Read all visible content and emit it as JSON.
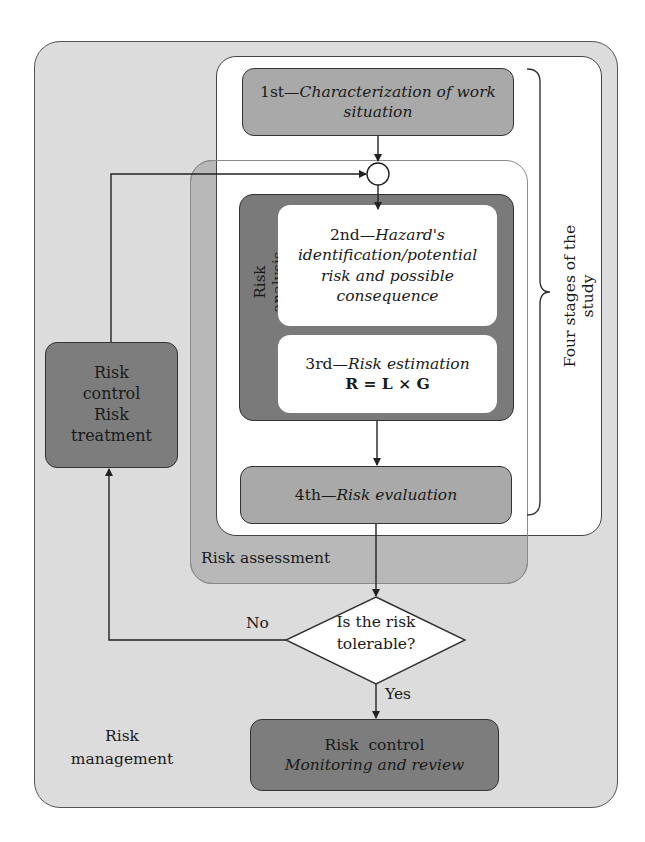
{
  "diagram": {
    "outer_container": {
      "label_line1": "Risk",
      "label_line2": "management"
    },
    "stages_group": {
      "label": "Four stages of the study"
    },
    "assessment_group": {
      "label": "Risk assessment"
    },
    "analysis_group": {
      "label": "Risk analysis"
    },
    "steps": [
      {
        "prefix": "1st—",
        "title": "Characterization of work situation"
      },
      {
        "prefix": "2nd—",
        "title_line1": "Hazard's",
        "title_line2": "identification/potential",
        "title_line3": "risk and possible",
        "title_line4": "consequence"
      },
      {
        "prefix": "3rd—",
        "title": "Risk estimation",
        "formula": "R = L × G"
      },
      {
        "prefix": "4th—",
        "title": "Risk evaluation"
      }
    ],
    "decision": {
      "line1": "Is the risk",
      "line2": "tolerable?",
      "no_label": "No",
      "yes_label": "Yes"
    },
    "treatment_box": {
      "line1": "Risk",
      "line2": "control",
      "line3": "Risk",
      "line4": "treatment"
    },
    "control_box": {
      "line1": "Risk  control",
      "line2": "Monitoring and review"
    },
    "colors": {
      "outer_fill": "#dcdcdc",
      "assessment_fill": "#b8b8b8",
      "stage_box_fill": "#a9a9a9",
      "dark_box_fill": "#7d7d7d",
      "stages_fill": "#ffffff"
    }
  }
}
